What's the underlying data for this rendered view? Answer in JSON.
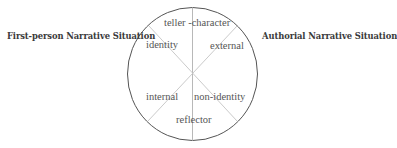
{
  "diagram": {
    "left_title": "First-person Narrative Situation",
    "right_title": "Authorial Narrative Situation",
    "segments": {
      "top": "teller -character",
      "upper_left": "identity",
      "upper_right": "external",
      "lower_left": "internal",
      "lower_right": "non-identity",
      "bottom": "reflector"
    },
    "colors": {
      "circle": "#555555",
      "axis_lines": "#b0b0b0",
      "diagonal_lines": "#c8c8c8",
      "text": "#555555",
      "title_text": "#3a3a3a"
    }
  }
}
